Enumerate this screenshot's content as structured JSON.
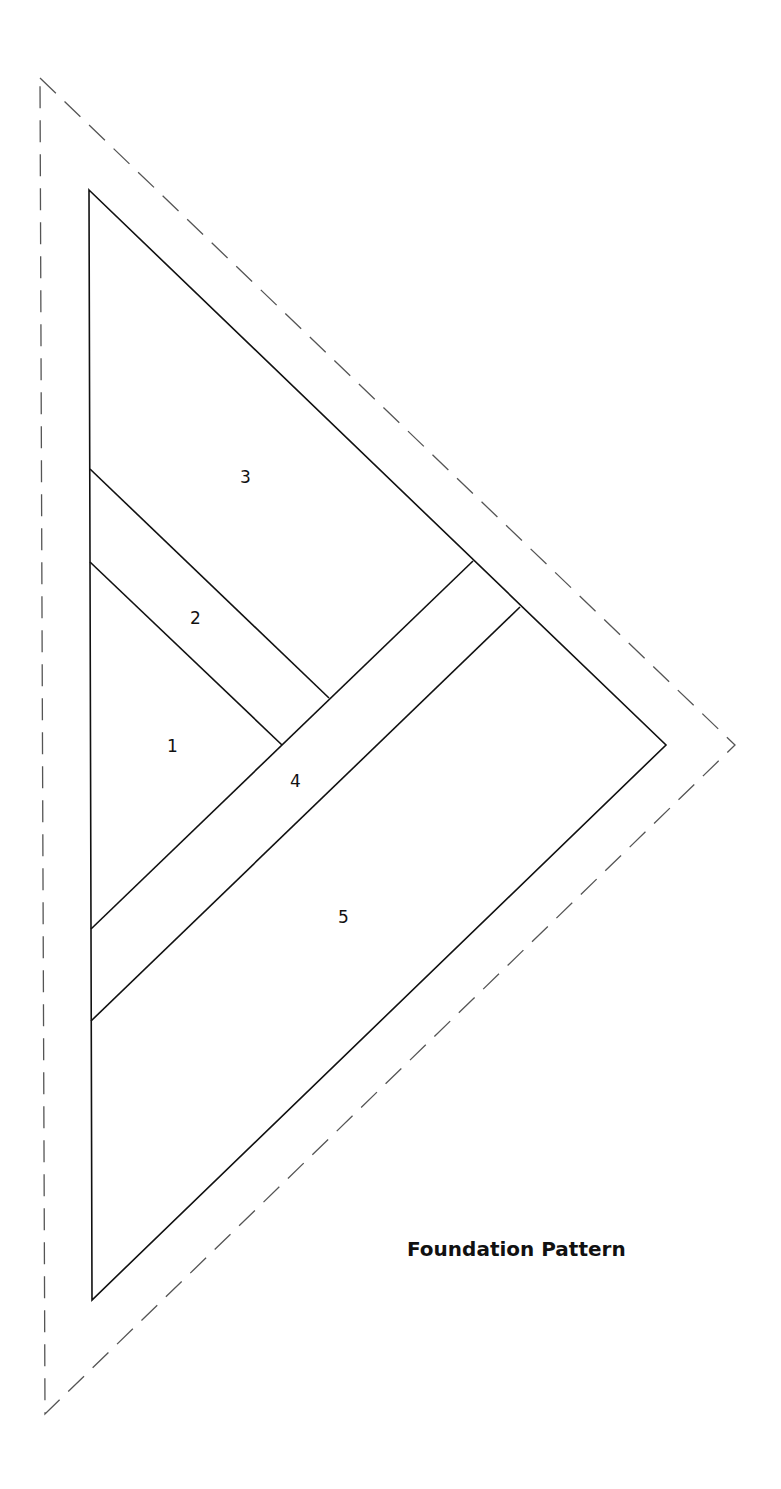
{
  "title": "Foundation Pattern",
  "colors": {
    "line": "#111111",
    "seam_allowance": "#555555",
    "background": "#ffffff"
  },
  "pieces": [
    {
      "number": "1",
      "label": "1"
    },
    {
      "number": "2",
      "label": "2"
    },
    {
      "number": "3",
      "label": "3"
    },
    {
      "number": "4",
      "label": "4"
    },
    {
      "number": "5",
      "label": "5"
    }
  ],
  "outline": {
    "inner_triangle": "solid",
    "outer_triangle": "dashed"
  }
}
